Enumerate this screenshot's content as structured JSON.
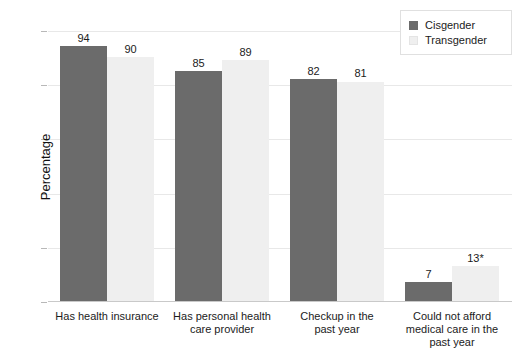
{
  "chart_data": {
    "type": "bar",
    "title": "",
    "xlabel": "",
    "ylabel": "Percentage",
    "ylim": [
      0,
      100
    ],
    "yticks": [
      0,
      20,
      40,
      60,
      80,
      100
    ],
    "grid": true,
    "legend_position": "top-right",
    "categories": [
      "Has health insurance",
      "Has personal health care provider",
      "Checkup in the past year",
      "Could not afford medical care in the past year"
    ],
    "category_lines": [
      [
        "Has health insurance"
      ],
      [
        "Has personal health",
        "care provider"
      ],
      [
        "Checkup in the",
        "past year"
      ],
      [
        "Could not afford",
        "medical care in the",
        "past year"
      ]
    ],
    "series": [
      {
        "name": "Cisgender",
        "color": "#6b6b6b",
        "values": [
          94,
          85,
          82,
          7
        ],
        "labels": [
          "94",
          "85",
          "82",
          "7"
        ]
      },
      {
        "name": "Transgender",
        "color": "#efefef",
        "values": [
          90,
          89,
          81,
          13
        ],
        "labels": [
          "90",
          "89",
          "81",
          "13*"
        ]
      }
    ]
  },
  "axis": {
    "y_title": "Percentage",
    "y_tick_labels": [
      "100",
      "80",
      "60",
      "40",
      "20",
      "0"
    ]
  },
  "legend": {
    "items": [
      {
        "label": "Cisgender",
        "color": "#6b6b6b"
      },
      {
        "label": "Transgender",
        "color": "#efefef"
      }
    ]
  },
  "colors": {
    "cisgender": "#6b6b6b",
    "transgender": "#efefef",
    "gridline": "#e8e8e8",
    "text": "#1b1b1b",
    "background": "#ffffff"
  }
}
